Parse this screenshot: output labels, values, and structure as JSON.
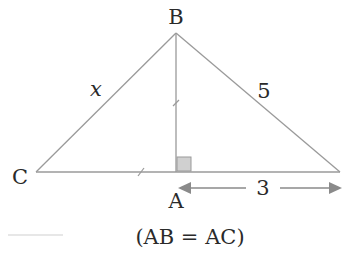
{
  "diagram": {
    "vertices": {
      "A": {
        "label": "A",
        "x": 176,
        "y": 172
      },
      "B": {
        "label": "B",
        "x": 176,
        "y": 33
      },
      "C": {
        "label": "C",
        "x": 36,
        "y": 172
      },
      "D": {
        "label": "",
        "x": 340,
        "y": 172
      }
    },
    "side_labels": {
      "BC": "x",
      "BD": "5",
      "AD": "3"
    },
    "caption": "(AB = AC)",
    "colors": {
      "line": "#9a9a9a",
      "text": "#2a2a2a",
      "right_angle_fill": "#d0d0d0"
    }
  }
}
